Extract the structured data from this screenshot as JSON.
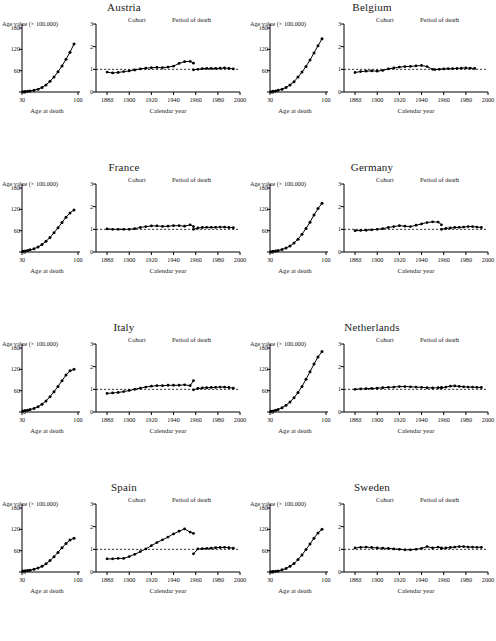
{
  "figure": {
    "panel_titles": [
      "Austria",
      "Belgium",
      "France",
      "Germany",
      "Italy",
      "Netherlands",
      "Spain",
      "Sweden"
    ],
    "left_axis": {
      "ylabel": "Age value (× 100,000)",
      "xlabel": "Age at death",
      "yticks": [
        "0",
        "60",
        "120",
        "180"
      ],
      "xticks": [
        "30",
        "100"
      ],
      "ylim": [
        0,
        180
      ],
      "xlim": [
        30,
        100
      ]
    },
    "right_axis": {
      "xlabel": "Calendar year",
      "yticks": [
        "0",
        "1",
        "2",
        "3"
      ],
      "xticks": [
        "1880",
        "1900",
        "1920",
        "1940",
        "1960",
        "1980",
        "2000"
      ],
      "ylim": [
        0,
        3
      ],
      "xlim": [
        1870,
        2000
      ],
      "reference_line": 1
    },
    "legend": {
      "cohort": "Cohort",
      "period": "Period of death"
    }
  },
  "chart_data": [
    {
      "type": "line",
      "title": "Austria",
      "subplot": "left",
      "xlabel": "Age at death",
      "ylabel": "Age value (× 100,000)",
      "xlim": [
        30,
        100
      ],
      "ylim": [
        0,
        180
      ],
      "x": [
        31,
        34,
        37,
        40,
        45,
        50,
        55,
        60,
        65,
        70,
        75,
        80,
        85,
        90,
        95
      ],
      "values": [
        1,
        1.5,
        2,
        3,
        5,
        8,
        13,
        20,
        30,
        42,
        57,
        73,
        92,
        112,
        135
      ]
    },
    {
      "type": "line",
      "title": "Austria",
      "subplot": "right",
      "xlabel": "Calendar year",
      "ylabel": "",
      "xlim": [
        1870,
        2000
      ],
      "ylim": [
        0,
        3
      ],
      "series": [
        {
          "name": "Cohort",
          "x": [
            1880,
            1885,
            1890,
            1895,
            1900,
            1905,
            1910,
            1915,
            1920,
            1925,
            1930,
            1935,
            1940,
            1945,
            1950,
            1955,
            1958
          ],
          "values": [
            0.88,
            0.84,
            0.86,
            0.9,
            0.93,
            0.97,
            1.02,
            1.05,
            1.07,
            1.08,
            1.07,
            1.1,
            1.14,
            1.26,
            1.34,
            1.35,
            1.27
          ]
        },
        {
          "name": "Period of death",
          "x": [
            1958,
            1962,
            1966,
            1970,
            1974,
            1978,
            1982,
            1986,
            1990,
            1994
          ],
          "values": [
            0.98,
            1.0,
            1.03,
            1.04,
            1.04,
            1.04,
            1.05,
            1.06,
            1.04,
            1.02
          ]
        }
      ]
    },
    {
      "type": "line",
      "title": "Belgium",
      "subplot": "left",
      "xlabel": "Age at death",
      "ylabel": "Age value (× 100,000)",
      "xlim": [
        30,
        100
      ],
      "ylim": [
        0,
        180
      ],
      "x": [
        31,
        34,
        37,
        40,
        45,
        50,
        55,
        60,
        65,
        70,
        75,
        80,
        85,
        90,
        95
      ],
      "values": [
        1,
        2,
        3,
        5,
        8,
        13,
        20,
        29,
        42,
        56,
        72,
        90,
        110,
        130,
        150
      ]
    },
    {
      "type": "line",
      "title": "Belgium",
      "subplot": "right",
      "xlabel": "Calendar year",
      "ylabel": "",
      "xlim": [
        1870,
        2000
      ],
      "ylim": [
        0,
        3
      ],
      "series": [
        {
          "name": "Cohort",
          "x": [
            1880,
            1885,
            1890,
            1895,
            1900,
            1905,
            1910,
            1915,
            1920,
            1925,
            1930,
            1935,
            1940,
            1945,
            1950
          ],
          "values": [
            0.86,
            0.9,
            0.92,
            0.93,
            0.92,
            0.95,
            1.02,
            1.06,
            1.1,
            1.12,
            1.13,
            1.15,
            1.17,
            1.12,
            1.0
          ]
        },
        {
          "name": "Period of death",
          "x": [
            1952,
            1956,
            1960,
            1964,
            1968,
            1972,
            1976,
            1980,
            1984,
            1988
          ],
          "values": [
            0.99,
            1.0,
            1.02,
            1.03,
            1.03,
            1.04,
            1.05,
            1.06,
            1.05,
            1.04
          ]
        }
      ]
    },
    {
      "type": "line",
      "title": "France",
      "subplot": "left",
      "xlabel": "Age at death",
      "ylabel": "Age value (× 100,000)",
      "xlim": [
        30,
        100
      ],
      "ylim": [
        0,
        180
      ],
      "x": [
        31,
        34,
        37,
        40,
        45,
        50,
        55,
        60,
        65,
        70,
        75,
        80,
        85,
        90,
        95
      ],
      "values": [
        2,
        3,
        4,
        6,
        9,
        14,
        21,
        30,
        41,
        54,
        68,
        83,
        98,
        110,
        118
      ]
    },
    {
      "type": "line",
      "title": "France",
      "subplot": "right",
      "xlabel": "Calendar year",
      "ylabel": "",
      "xlim": [
        1870,
        2000
      ],
      "ylim": [
        0,
        3
      ],
      "series": [
        {
          "name": "Cohort",
          "x": [
            1880,
            1885,
            1890,
            1895,
            1900,
            1905,
            1910,
            1915,
            1920,
            1925,
            1930,
            1935,
            1940,
            1945,
            1950,
            1955,
            1958
          ],
          "values": [
            1.02,
            1.0,
            1.0,
            1.0,
            1.0,
            1.03,
            1.08,
            1.12,
            1.15,
            1.15,
            1.13,
            1.14,
            1.16,
            1.16,
            1.14,
            1.2,
            1.12
          ]
        },
        {
          "name": "Period of death",
          "x": [
            1958,
            1962,
            1966,
            1970,
            1974,
            1978,
            1982,
            1986,
            1990,
            1994
          ],
          "values": [
            1.0,
            1.06,
            1.08,
            1.09,
            1.09,
            1.09,
            1.1,
            1.1,
            1.08,
            1.07
          ]
        }
      ]
    },
    {
      "type": "line",
      "title": "Germany",
      "subplot": "left",
      "xlabel": "Age at death",
      "ylabel": "Age value (× 100,000)",
      "xlim": [
        30,
        100
      ],
      "ylim": [
        0,
        180
      ],
      "x": [
        31,
        34,
        37,
        40,
        45,
        50,
        55,
        60,
        65,
        70,
        75,
        80,
        85,
        90,
        95
      ],
      "values": [
        1,
        2,
        3,
        4,
        7,
        11,
        17,
        25,
        36,
        50,
        66,
        84,
        104,
        122,
        137
      ]
    },
    {
      "type": "line",
      "title": "Germany",
      "subplot": "right",
      "xlabel": "Calendar year",
      "ylabel": "",
      "xlim": [
        1870,
        2000
      ],
      "ylim": [
        0,
        3
      ],
      "series": [
        {
          "name": "Cohort",
          "x": [
            1880,
            1885,
            1890,
            1895,
            1900,
            1905,
            1910,
            1915,
            1920,
            1925,
            1930,
            1935,
            1940,
            1945,
            1950,
            1955,
            1958
          ],
          "values": [
            0.94,
            0.95,
            0.96,
            0.98,
            1.0,
            1.03,
            1.08,
            1.12,
            1.16,
            1.14,
            1.12,
            1.18,
            1.24,
            1.3,
            1.33,
            1.32,
            1.2
          ]
        },
        {
          "name": "Period of death",
          "x": [
            1958,
            1962,
            1966,
            1970,
            1974,
            1978,
            1982,
            1986,
            1990,
            1994
          ],
          "values": [
            1.0,
            1.04,
            1.06,
            1.08,
            1.09,
            1.1,
            1.12,
            1.12,
            1.1,
            1.08
          ]
        }
      ]
    },
    {
      "type": "line",
      "title": "Italy",
      "subplot": "left",
      "xlabel": "Age at death",
      "ylabel": "Age value (× 100,000)",
      "xlim": [
        30,
        100
      ],
      "ylim": [
        0,
        180
      ],
      "x": [
        31,
        34,
        37,
        40,
        45,
        50,
        55,
        60,
        65,
        70,
        75,
        80,
        85,
        90,
        95
      ],
      "values": [
        3,
        4,
        5,
        7,
        10,
        15,
        22,
        31,
        43,
        57,
        72,
        88,
        104,
        116,
        120
      ]
    },
    {
      "type": "line",
      "title": "Italy",
      "subplot": "right",
      "xlabel": "Calendar year",
      "ylabel": "",
      "xlim": [
        1870,
        2000
      ],
      "ylim": [
        0,
        3
      ],
      "series": [
        {
          "name": "Cohort",
          "x": [
            1880,
            1885,
            1890,
            1895,
            1900,
            1905,
            1910,
            1915,
            1920,
            1925,
            1930,
            1935,
            1940,
            1945,
            1950,
            1955,
            1958
          ],
          "values": [
            0.82,
            0.84,
            0.86,
            0.9,
            0.95,
            1.0,
            1.05,
            1.1,
            1.14,
            1.16,
            1.16,
            1.18,
            1.18,
            1.18,
            1.2,
            1.16,
            1.38
          ]
        },
        {
          "name": "Period of death",
          "x": [
            1958,
            1962,
            1966,
            1970,
            1974,
            1978,
            1982,
            1986,
            1990,
            1994
          ],
          "values": [
            0.98,
            1.04,
            1.06,
            1.07,
            1.08,
            1.09,
            1.1,
            1.1,
            1.08,
            1.05
          ]
        }
      ]
    },
    {
      "type": "line",
      "title": "Netherlands",
      "subplot": "left",
      "xlabel": "Age at death",
      "ylabel": "Age value (× 100,000)",
      "xlim": [
        30,
        100
      ],
      "ylim": [
        0,
        180
      ],
      "x": [
        31,
        34,
        37,
        40,
        45,
        50,
        55,
        60,
        65,
        70,
        75,
        80,
        85,
        90,
        95
      ],
      "values": [
        2,
        3,
        5,
        7,
        12,
        19,
        28,
        40,
        55,
        72,
        92,
        113,
        135,
        155,
        170
      ]
    },
    {
      "type": "line",
      "title": "Netherlands",
      "subplot": "right",
      "xlabel": "Calendar year",
      "ylabel": "",
      "xlim": [
        1870,
        2000
      ],
      "ylim": [
        0,
        3
      ],
      "series": [
        {
          "name": "Cohort",
          "x": [
            1880,
            1885,
            1890,
            1895,
            1900,
            1905,
            1910,
            1915,
            1920,
            1925,
            1930,
            1935,
            1940,
            1945,
            1950,
            1955,
            1958
          ],
          "values": [
            1.0,
            1.02,
            1.03,
            1.04,
            1.05,
            1.07,
            1.09,
            1.1,
            1.12,
            1.12,
            1.11,
            1.1,
            1.09,
            1.07,
            1.06,
            1.07,
            1.08
          ]
        },
        {
          "name": "Period of death",
          "x": [
            1958,
            1962,
            1966,
            1970,
            1974,
            1978,
            1982,
            1986,
            1990,
            1994
          ],
          "values": [
            1.06,
            1.1,
            1.14,
            1.15,
            1.13,
            1.11,
            1.1,
            1.1,
            1.09,
            1.08
          ]
        }
      ]
    },
    {
      "type": "line",
      "title": "Spain",
      "subplot": "left",
      "xlabel": "Age at death",
      "ylabel": "Age value (× 100,000)",
      "xlim": [
        30,
        100
      ],
      "ylim": [
        0,
        180
      ],
      "x": [
        31,
        34,
        37,
        40,
        45,
        50,
        55,
        60,
        65,
        70,
        75,
        80,
        85,
        90,
        95
      ],
      "values": [
        3,
        3.5,
        4,
        5,
        8,
        11,
        16,
        23,
        32,
        43,
        55,
        68,
        80,
        90,
        95
      ]
    },
    {
      "type": "line",
      "title": "Spain",
      "subplot": "right",
      "xlabel": "Calendar year",
      "ylabel": "",
      "xlim": [
        1870,
        2000
      ],
      "ylim": [
        0,
        3
      ],
      "series": [
        {
          "name": "Cohort",
          "x": [
            1880,
            1885,
            1890,
            1895,
            1900,
            1905,
            1910,
            1915,
            1920,
            1925,
            1930,
            1935,
            1940,
            1945,
            1950,
            1955,
            1958
          ],
          "values": [
            0.58,
            0.58,
            0.6,
            0.6,
            0.68,
            0.78,
            0.9,
            1.02,
            1.16,
            1.3,
            1.42,
            1.54,
            1.68,
            1.8,
            1.9,
            1.76,
            1.7
          ]
        },
        {
          "name": "Period of death",
          "x": [
            1958,
            1962,
            1966,
            1970,
            1974,
            1978,
            1982,
            1986,
            1990,
            1994
          ],
          "values": [
            0.8,
            1.02,
            1.03,
            1.04,
            1.05,
            1.07,
            1.08,
            1.09,
            1.07,
            1.05
          ]
        }
      ]
    },
    {
      "type": "line",
      "title": "Sweden",
      "subplot": "left",
      "xlabel": "Age at death",
      "ylabel": "Age value (× 100,000)",
      "xlim": [
        30,
        100
      ],
      "ylim": [
        0,
        180
      ],
      "x": [
        31,
        34,
        37,
        40,
        45,
        50,
        55,
        60,
        65,
        70,
        75,
        80,
        85,
        90,
        95
      ],
      "values": [
        1,
        1.5,
        2,
        3,
        6,
        10,
        16,
        24,
        35,
        48,
        63,
        79,
        95,
        110,
        120
      ]
    },
    {
      "type": "line",
      "title": "Sweden",
      "subplot": "right",
      "xlabel": "Calendar year",
      "ylabel": "",
      "xlim": [
        1870,
        2000
      ],
      "ylim": [
        0,
        3
      ],
      "series": [
        {
          "name": "Cohort",
          "x": [
            1880,
            1885,
            1890,
            1895,
            1900,
            1905,
            1910,
            1915,
            1920,
            1925,
            1930,
            1935,
            1940,
            1945,
            1950,
            1955,
            1958
          ],
          "values": [
            1.06,
            1.09,
            1.1,
            1.08,
            1.06,
            1.05,
            1.04,
            1.02,
            1.0,
            0.98,
            0.98,
            1.0,
            1.04,
            1.12,
            1.06,
            1.1,
            1.06
          ]
        },
        {
          "name": "Period of death",
          "x": [
            1958,
            1962,
            1966,
            1970,
            1974,
            1978,
            1982,
            1986,
            1990,
            1994
          ],
          "values": [
            1.04,
            1.06,
            1.08,
            1.1,
            1.12,
            1.12,
            1.1,
            1.1,
            1.09,
            1.09
          ]
        }
      ]
    }
  ]
}
